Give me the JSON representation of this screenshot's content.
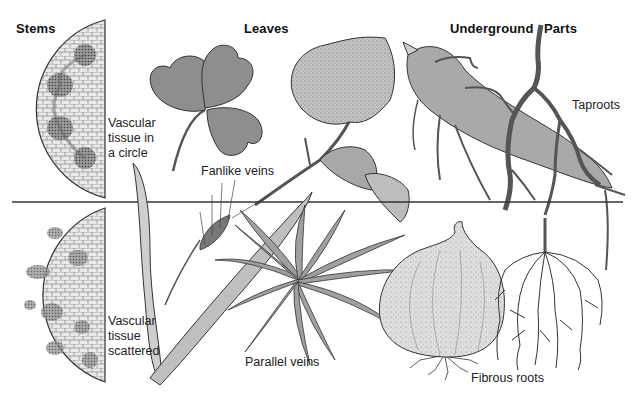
{
  "headings": {
    "stems": "Stems",
    "leaves": "Leaves",
    "underground": "Underground",
    "parts": "Parts"
  },
  "labels": {
    "vascular_circle_1": "Vascular",
    "vascular_circle_2": "tissue in",
    "vascular_circle_3": "a circle",
    "fanlike_veins": "Fanlike veins",
    "taproots": "Taproots",
    "vascular_scattered_1": "Vascular",
    "vascular_scattered_2": "tissue",
    "vascular_scattered_3": "scattered",
    "parallel_veins": "Parallel veins",
    "fibrous_roots": "Fibrous roots"
  },
  "rows": [
    {
      "name": "dicot",
      "stem": "Vascular tissue in a circle",
      "leaf": "Fanlike veins",
      "root": "Taproots"
    },
    {
      "name": "monocot",
      "stem": "Vascular tissue scattered",
      "leaf": "Parallel veins",
      "root": "Fibrous roots"
    }
  ],
  "colors": {
    "background": "#ffffff",
    "ink": "#1a1a1a",
    "fill_dark": "#8a8a8a",
    "fill_mid": "#b3b3b3",
    "fill_light": "#d9d9d9"
  }
}
